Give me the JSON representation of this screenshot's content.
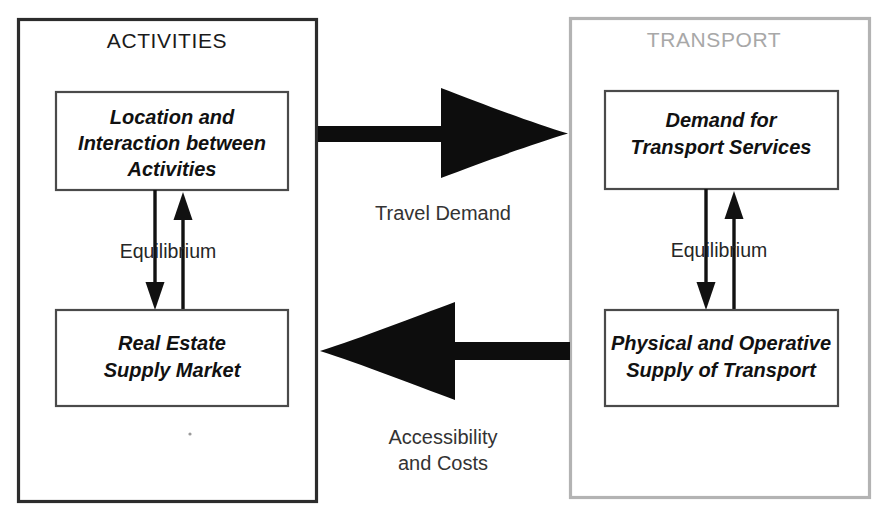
{
  "diagram": {
    "canvas": {
      "width": 881,
      "height": 518,
      "background": "#ffffff"
    },
    "panels": [
      {
        "id": "activities",
        "title": "ACTIVITIES",
        "title_color": "#1a1a1a",
        "border_color": "#2c2c2c",
        "boxes": [
          {
            "id": "location-interaction",
            "lines": [
              "Location and",
              "Interaction between",
              "Activities"
            ]
          },
          {
            "id": "real-estate",
            "lines": [
              "Real Estate",
              "Supply Market"
            ]
          }
        ],
        "equilibrium_label": "Equilibrium"
      },
      {
        "id": "transport",
        "title": "TRANSPORT",
        "title_color": "#a8a8a8",
        "border_color": "#b3b3b3",
        "boxes": [
          {
            "id": "demand-transport-services",
            "lines": [
              "Demand for",
              "Transport Services"
            ]
          },
          {
            "id": "physical-operative-supply",
            "lines": [
              "Physical and Operative",
              "Supply of Transport"
            ]
          }
        ],
        "equilibrium_label": "Equilibrium"
      }
    ],
    "flows": [
      {
        "id": "travel-demand",
        "direction": "right",
        "from": "activities",
        "to": "transport",
        "lines": [
          "Travel Demand"
        ],
        "color": "#0d0d0d"
      },
      {
        "id": "accessibility-and-costs",
        "direction": "left",
        "from": "transport",
        "to": "activities",
        "lines": [
          "Accessibility",
          "and Costs"
        ],
        "color": "#0d0d0d"
      }
    ]
  }
}
